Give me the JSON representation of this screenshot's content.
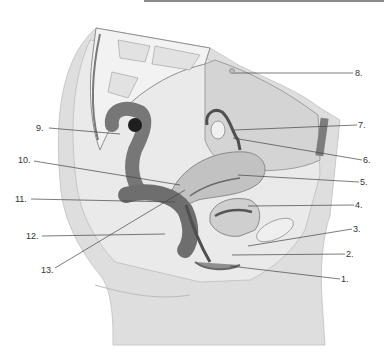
{
  "diagram": {
    "colors": {
      "skin": "#d9d9d9",
      "tissue": "#e6e6e6",
      "organ": "#9a9a9a",
      "dark": "#5e5e5e",
      "bone": "#efefef",
      "line": "#444444",
      "text": "#333333"
    },
    "labels": [
      {
        "id": "1",
        "text": "1.",
        "x": 341,
        "y": 275,
        "lx1": 230,
        "ly1": 266,
        "lx2": 340,
        "ly2": 279
      },
      {
        "id": "2",
        "text": "2.",
        "x": 346,
        "y": 250,
        "lx1": 232,
        "ly1": 255,
        "lx2": 345,
        "ly2": 254
      },
      {
        "id": "3",
        "text": "3.",
        "x": 353,
        "y": 225,
        "lx1": 248,
        "ly1": 246,
        "lx2": 352,
        "ly2": 229
      },
      {
        "id": "4",
        "text": "4.",
        "x": 355,
        "y": 201,
        "lx1": 248,
        "ly1": 206,
        "lx2": 354,
        "ly2": 205
      },
      {
        "id": "5",
        "text": "5.",
        "x": 360,
        "y": 178,
        "lx1": 238,
        "ly1": 175,
        "lx2": 359,
        "ly2": 182
      },
      {
        "id": "6",
        "text": "6.",
        "x": 363,
        "y": 156,
        "lx1": 233,
        "ly1": 138,
        "lx2": 362,
        "ly2": 160
      },
      {
        "id": "7",
        "text": "7.",
        "x": 358,
        "y": 121,
        "lx1": 234,
        "ly1": 130,
        "lx2": 357,
        "ly2": 125
      },
      {
        "id": "8",
        "text": "8.",
        "x": 355,
        "y": 69,
        "lx1": 232,
        "ly1": 73,
        "lx2": 353,
        "ly2": 73
      },
      {
        "id": "9",
        "text": "9.",
        "x": 36,
        "y": 124,
        "lx1": 49,
        "ly1": 128,
        "lx2": 120,
        "ly2": 134
      },
      {
        "id": "10",
        "text": "10.",
        "x": 18,
        "y": 156,
        "lx1": 34,
        "ly1": 161,
        "lx2": 180,
        "ly2": 185
      },
      {
        "id": "11",
        "text": "11.",
        "x": 15,
        "y": 195,
        "lx1": 31,
        "ly1": 199,
        "lx2": 175,
        "ly2": 202
      },
      {
        "id": "12",
        "text": "12.",
        "x": 26,
        "y": 232,
        "lx1": 42,
        "ly1": 236,
        "lx2": 165,
        "ly2": 234
      },
      {
        "id": "13",
        "text": "13.",
        "x": 41,
        "y": 266,
        "lx1": 55,
        "ly1": 268,
        "lx2": 185,
        "ly2": 190
      }
    ]
  }
}
